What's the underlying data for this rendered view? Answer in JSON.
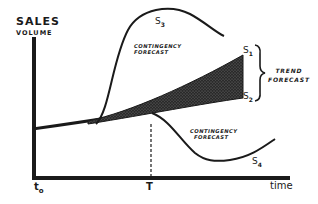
{
  "diagram": {
    "y_axis": {
      "title": "SALES",
      "subtitle": "VOLUME"
    },
    "x_axis": {
      "label": "time",
      "ticks": [
        {
          "base": "t",
          "sub": "o"
        },
        {
          "base": "T",
          "sub": ""
        }
      ]
    },
    "curves": {
      "s1": {
        "base": "S",
        "sub": "1"
      },
      "s2": {
        "base": "S",
        "sub": "2"
      },
      "s3": {
        "base": "S",
        "sub": "3"
      },
      "s4": {
        "base": "S",
        "sub": "4"
      }
    },
    "annotations": {
      "contingency_upper": {
        "line1": "CONTINGENCY",
        "line2": "FORECAST"
      },
      "contingency_lower": {
        "line1": "CONTINGENCY",
        "line2": "FORECAST"
      },
      "trend": {
        "line1": "TREND",
        "line2": "FORECAST"
      }
    },
    "colors": {
      "ink": "#1a1a1a",
      "background": "#ffffff",
      "shading": "#2a2a2a"
    }
  }
}
